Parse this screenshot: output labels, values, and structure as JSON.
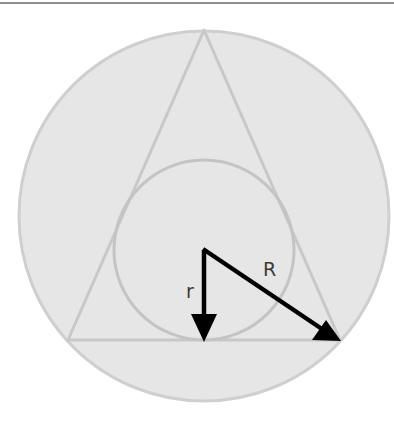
{
  "figure": {
    "colors": {
      "rule": "#8e8e8e",
      "outer_circle_fill": "#e6e6e6",
      "outer_circle_stroke": "#cfcfcf",
      "triangle_stroke": "#c8c8c8",
      "incircle_stroke": "#c4c4c4",
      "arrow": "#000000",
      "label": "#3a3a3a"
    },
    "outer_circle": {
      "cx": 204,
      "cy": 216,
      "r": 185
    },
    "triangle": {
      "apex": [
        204,
        30
      ],
      "base_left": [
        68,
        340
      ],
      "base_right": [
        340,
        340
      ]
    },
    "incircle": {
      "cx": 204,
      "cy": 250,
      "r": 90
    },
    "arrows": {
      "origin": [
        204,
        250
      ],
      "inradius_end": [
        204,
        340
      ],
      "circumradius_end": [
        340,
        340
      ]
    },
    "labels": {
      "inradius": "r",
      "circumradius": "R"
    }
  }
}
